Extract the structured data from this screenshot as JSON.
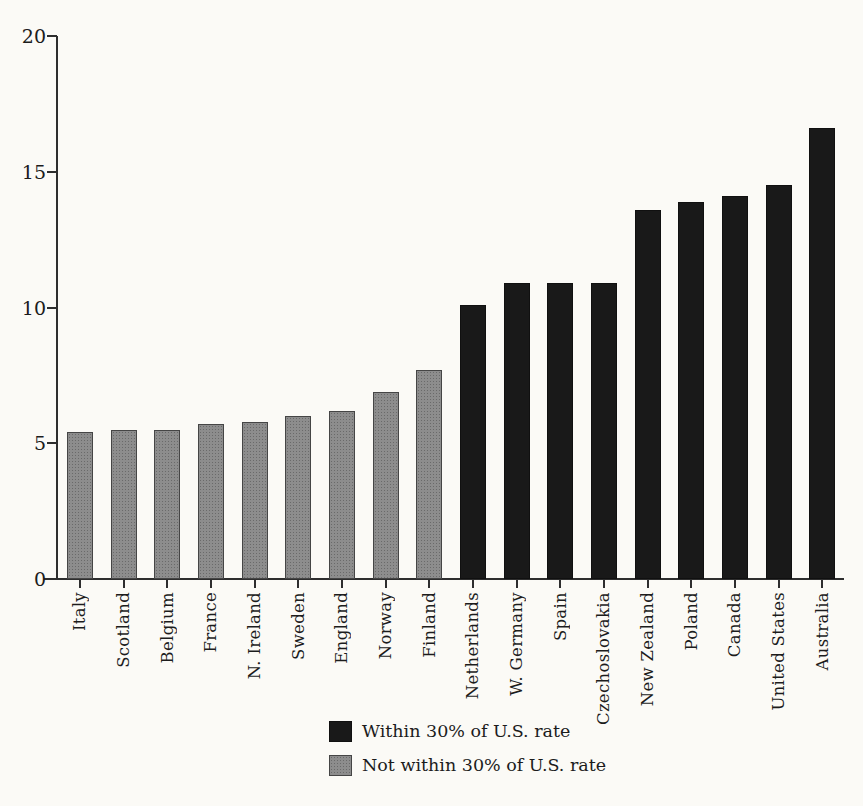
{
  "chart_data": {
    "type": "bar",
    "title": "",
    "xlabel": "",
    "ylabel": "",
    "ylim": [
      0,
      20
    ],
    "yticks": [
      0,
      5,
      10,
      15,
      20
    ],
    "grid": false,
    "legend_position": "bottom-center",
    "categories": [
      "Italy",
      "Scotland",
      "Belgium",
      "France",
      "N. Ireland",
      "Sweden",
      "England",
      "Norway",
      "Finland",
      "Netherlands",
      "W. Germany",
      "Spain",
      "Czechoslovakia",
      "New Zealand",
      "Poland",
      "Canada",
      "United States",
      "Australia"
    ],
    "values": [
      5.4,
      5.5,
      5.5,
      5.7,
      5.8,
      6.0,
      6.2,
      6.9,
      7.7,
      10.1,
      10.9,
      10.9,
      10.9,
      13.6,
      13.9,
      14.1,
      14.5,
      16.6
    ],
    "groups": [
      "not_within",
      "not_within",
      "not_within",
      "not_within",
      "not_within",
      "not_within",
      "not_within",
      "not_within",
      "not_within",
      "within",
      "within",
      "within",
      "within",
      "within",
      "within",
      "within",
      "within",
      "within"
    ],
    "colors": {
      "within": "#191919",
      "not_within": "#8d8d8d"
    }
  },
  "legend": {
    "items": [
      {
        "key": "within",
        "label": "Within 30% of U.S. rate",
        "color": "#191919"
      },
      {
        "key": "not_within",
        "label": "Not within 30% of U.S. rate",
        "color": "#8d8d8d"
      }
    ]
  }
}
